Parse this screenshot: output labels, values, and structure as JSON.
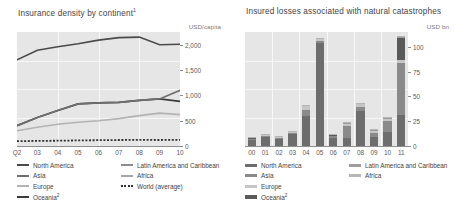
{
  "left": {
    "title": "Insurance density by continent",
    "title_superscript": "1",
    "unit": "USD/capita",
    "legend": [
      {
        "label": "North America",
        "sup": "",
        "color": "#4a4a4a",
        "style": "line"
      },
      {
        "label": "Asia",
        "sup": "",
        "color": "#6f6f6f",
        "style": "line"
      },
      {
        "label": "Europe",
        "sup": "",
        "color": "#b3b3b3",
        "style": "line"
      },
      {
        "label": "Oceania",
        "sup": "2",
        "color": "#3a3a3a",
        "style": "line"
      },
      {
        "label": "Latin America and Caribbean",
        "sup": "",
        "color": "#8c8c8c",
        "style": "line"
      },
      {
        "label": "Africa",
        "sup": "",
        "color": "#a8a8a8",
        "style": "line"
      },
      {
        "label": "World (average)",
        "sup": "",
        "color": "#2f2f2f",
        "style": "dashed"
      }
    ]
  },
  "right": {
    "title": "Insured losses associated with natural catastrophes",
    "unit": "USD bn",
    "legend": [
      {
        "label": "North America",
        "sup": "",
        "color": "#6d6d6d"
      },
      {
        "label": "Asia",
        "sup": "",
        "color": "#8a8a8a"
      },
      {
        "label": "Europe",
        "sup": "",
        "color": "#c6c6c6"
      },
      {
        "label": "Oceania",
        "sup": "2",
        "color": "#5a5a5a"
      },
      {
        "label": "Latin America and Caribbean",
        "sup": "",
        "color": "#9e9e9e"
      },
      {
        "label": "Africa",
        "sup": "",
        "color": "#b5b5b5"
      }
    ]
  },
  "chart_data": [
    {
      "type": "line",
      "title": "Insurance density by continent1",
      "xlabel": "",
      "ylabel": "USD/capita",
      "ylim": [
        0,
        2250
      ],
      "yticks": [
        0,
        500,
        1000,
        1500,
        2000
      ],
      "ytick_labels": [
        "0",
        "500",
        "1,000",
        "1,500",
        "2,000"
      ],
      "x": [
        "Q2",
        "03",
        "04",
        "05",
        "06",
        "07",
        "08",
        "09",
        "10"
      ],
      "xtick_labels": [
        "Q2",
        "03",
        "04",
        "05",
        "06",
        "07",
        "08",
        "09",
        "10"
      ],
      "grid": true,
      "legend_position": "below",
      "series": [
        {
          "name": "North America",
          "color": "#4a4a4a",
          "style": "solid",
          "values": [
            1700,
            1890,
            1960,
            2020,
            2090,
            2140,
            2150,
            2000,
            2010
          ]
        },
        {
          "name": "Oceania2",
          "color": "#3a3a3a",
          "style": "solid",
          "values": [
            400,
            560,
            700,
            830,
            850,
            860,
            900,
            930,
            880
          ]
        },
        {
          "name": "Europe",
          "color": "#b3b3b3",
          "style": "solid",
          "values": [
            300,
            370,
            430,
            470,
            500,
            540,
            600,
            650,
            620
          ]
        },
        {
          "name": "Asia",
          "color": "#6f6f6f",
          "style": "solid",
          "values": [
            400,
            560,
            700,
            830,
            850,
            860,
            900,
            930,
            1100
          ]
        },
        {
          "name": "World (average)",
          "color": "#2f2f2f",
          "style": "dotted",
          "values": [
            95,
            100,
            105,
            110,
            115,
            118,
            120,
            118,
            122
          ]
        }
      ]
    },
    {
      "type": "bar",
      "subtype": "stacked",
      "title": "Insured losses associated with natural catastrophes",
      "xlabel": "",
      "ylabel": "USD bn",
      "ylim": [
        0,
        115
      ],
      "yticks": [
        0,
        25,
        50,
        75,
        100
      ],
      "ytick_labels": [
        "0",
        "25",
        "50",
        "75",
        "100"
      ],
      "categories": [
        "00",
        "01",
        "02",
        "03",
        "04",
        "05",
        "06",
        "07",
        "08",
        "09",
        "10",
        "11"
      ],
      "grid": true,
      "legend_position": "below",
      "series": [
        {
          "name": "North America",
          "color": "#6d6d6d",
          "values": [
            6,
            9,
            7,
            12,
            30,
            104,
            8,
            8,
            35,
            9,
            14,
            31
          ]
        },
        {
          "name": "Asia",
          "color": "#8a8a8a",
          "values": [
            1,
            1.5,
            1.5,
            1.5,
            6,
            2,
            2,
            12,
            4,
            4,
            11,
            53
          ]
        },
        {
          "name": "Europe",
          "color": "#c6c6c6",
          "values": [
            1,
            1,
            1,
            1,
            4,
            1.5,
            1,
            2,
            3,
            2,
            2,
            3
          ]
        },
        {
          "name": "Oceania2",
          "color": "#5a5a5a",
          "values": [
            0.5,
            0.5,
            0.5,
            0.5,
            1,
            1,
            0.5,
            1,
            1,
            1,
            1,
            23
          ]
        },
        {
          "name": "Latin America and Caribbean",
          "color": "#9e9e9e",
          "values": [
            0.3,
            0.3,
            0.3,
            0.3,
            0.5,
            0.5,
            0.3,
            0.5,
            0.5,
            0.5,
            0.5,
            0.5
          ]
        },
        {
          "name": "Africa",
          "color": "#b5b5b5",
          "values": [
            0.2,
            0.2,
            0.2,
            0.2,
            0.3,
            0.3,
            0.2,
            0.3,
            0.3,
            0.3,
            0.3,
            0.3
          ]
        }
      ]
    }
  ]
}
